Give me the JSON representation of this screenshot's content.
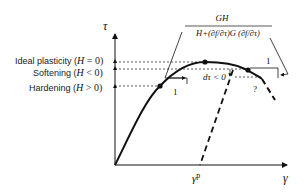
{
  "diagram": {
    "axes": {
      "y_label": "τ",
      "x_label": "γ",
      "x_marker": "γ",
      "x_marker_sup": "p"
    },
    "levels": [
      {
        "name": "ideal",
        "label": "Ideal plasticity (",
        "var": "H",
        "rel": " = 0)"
      },
      {
        "name": "softening",
        "label": "Softening (",
        "var": "H",
        "rel": " < 0)"
      },
      {
        "name": "hardening",
        "label": "Hardening (",
        "var": "H",
        "rel": " > 0)"
      }
    ],
    "formula": {
      "numerator": "GH",
      "denominator": "H+(∂f/∂τ)G (∂f/∂τ)"
    },
    "annotations": {
      "slope_left": "1",
      "slope_right": "1",
      "dtau": "dτ < 0",
      "question": "?"
    },
    "colors": {
      "line": "#111111",
      "background": "#ffffff"
    }
  }
}
